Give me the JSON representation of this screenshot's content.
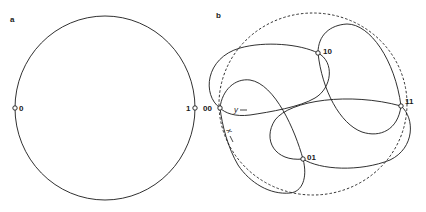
{
  "panel_a": {
    "label": "a",
    "nodes": [
      {
        "id": "0",
        "label": "0"
      },
      {
        "id": "1",
        "label": "1"
      }
    ]
  },
  "panel_b": {
    "label": "b",
    "nodes": [
      {
        "id": "00",
        "label": "00"
      },
      {
        "id": "10",
        "label": "10"
      },
      {
        "id": "11",
        "label": "11"
      },
      {
        "id": "01",
        "label": "01"
      }
    ],
    "axes": {
      "x_label": "x",
      "y_label": "y"
    }
  },
  "colors": {
    "stroke": "#1a1a1a",
    "background": "#ffffff"
  }
}
